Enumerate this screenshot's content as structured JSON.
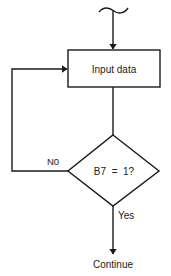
{
  "diagram": {
    "type": "flowchart",
    "colors": {
      "stroke": "#1a1a1a",
      "background": "#ffffff",
      "text": "#222222"
    },
    "nodes": [
      {
        "id": "entry",
        "shape": "break-symbol",
        "label": ""
      },
      {
        "id": "input",
        "shape": "rectangle",
        "label": "Input data"
      },
      {
        "id": "decision",
        "shape": "diamond",
        "label": "B7 = 1?"
      },
      {
        "id": "continue",
        "shape": "terminal-text",
        "label": "Continue"
      }
    ],
    "edges": [
      {
        "from": "entry",
        "to": "input",
        "label": ""
      },
      {
        "from": "input",
        "to": "decision",
        "label": ""
      },
      {
        "from": "decision",
        "to": "input",
        "label": "N0"
      },
      {
        "from": "decision",
        "to": "continue",
        "label": "Yes"
      }
    ],
    "labels": {
      "process": "Input data",
      "decision": "B7  =  1?",
      "no_branch": "N0",
      "yes_branch": "Yes",
      "terminal": "Continue"
    }
  }
}
